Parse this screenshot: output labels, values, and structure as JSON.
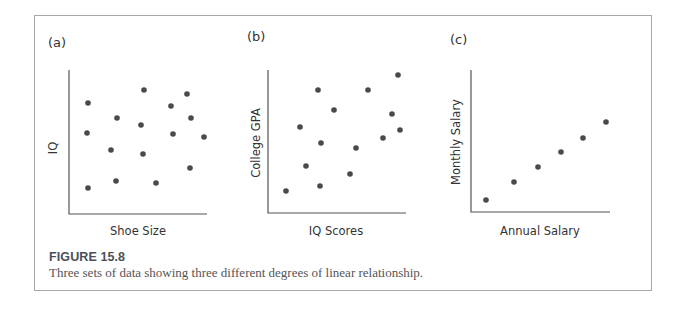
{
  "figure": {
    "title": "FIGURE 15.8",
    "caption": "Three sets of data showing three different degrees of linear relationship."
  },
  "chart_data": [
    {
      "type": "scatter",
      "panel_label": "(a)",
      "xlabel": "Shoe Size",
      "ylabel": "IQ",
      "title": "",
      "grid": false,
      "ticks": false,
      "relationship": "none",
      "axes_px": {
        "x0": 69,
        "y_top": 70,
        "y_bottom": 214,
        "x_end": 207
      },
      "points_px": [
        [
          88,
          103
        ],
        [
          144,
          90
        ],
        [
          187,
          94
        ],
        [
          171,
          106
        ],
        [
          117,
          118
        ],
        [
          191,
          118
        ],
        [
          141,
          125
        ],
        [
          87,
          133
        ],
        [
          173,
          134
        ],
        [
          204,
          137
        ],
        [
          111,
          150
        ],
        [
          143,
          154
        ],
        [
          190,
          168
        ],
        [
          116,
          181
        ],
        [
          156,
          183
        ],
        [
          88,
          188
        ]
      ],
      "x": [
        0.14,
        0.55,
        0.86,
        0.74,
        0.35,
        0.89,
        0.52,
        0.13,
        0.75,
        0.98,
        0.3,
        0.54,
        0.88,
        0.34,
        0.63,
        0.14
      ],
      "y": [
        0.78,
        0.87,
        0.84,
        0.76,
        0.67,
        0.67,
        0.62,
        0.56,
        0.56,
        0.53,
        0.44,
        0.42,
        0.32,
        0.23,
        0.22,
        0.18
      ]
    },
    {
      "type": "scatter",
      "panel_label": "(b)",
      "xlabel": "IQ Scores",
      "ylabel": "College GPA",
      "title": "",
      "grid": false,
      "ticks": false,
      "relationship": "moderate positive",
      "axes_px": {
        "x0": 268,
        "y_top": 70,
        "y_bottom": 213,
        "x_end": 406
      },
      "points_px": [
        [
          398,
          75
        ],
        [
          318,
          90
        ],
        [
          368,
          90
        ],
        [
          334,
          110
        ],
        [
          392,
          114
        ],
        [
          300,
          127
        ],
        [
          400,
          130
        ],
        [
          383,
          138
        ],
        [
          321,
          143
        ],
        [
          356,
          148
        ],
        [
          306,
          166
        ],
        [
          350,
          174
        ],
        [
          320,
          186
        ],
        [
          286,
          191
        ]
      ],
      "x": [
        0.94,
        0.36,
        0.72,
        0.48,
        0.9,
        0.23,
        0.96,
        0.83,
        0.38,
        0.64,
        0.28,
        0.59,
        0.38,
        0.13
      ],
      "y": [
        0.97,
        0.86,
        0.86,
        0.72,
        0.69,
        0.6,
        0.58,
        0.52,
        0.49,
        0.45,
        0.33,
        0.27,
        0.19,
        0.15
      ]
    },
    {
      "type": "scatter",
      "panel_label": "(c)",
      "xlabel": "Annual Salary",
      "ylabel": "Monthly Salary",
      "title": "",
      "grid": false,
      "ticks": false,
      "relationship": "perfect positive linear",
      "axes_px": {
        "x0": 471,
        "y_top": 70,
        "y_bottom": 212,
        "x_end": 610
      },
      "points_px": [
        [
          486,
          200
        ],
        [
          514,
          182
        ],
        [
          538,
          167
        ],
        [
          561,
          152
        ],
        [
          583,
          138
        ],
        [
          606,
          122
        ]
      ],
      "x": [
        0.11,
        0.31,
        0.48,
        0.65,
        0.81,
        0.97
      ],
      "y": [
        0.08,
        0.21,
        0.32,
        0.42,
        0.52,
        0.63
      ]
    }
  ],
  "labels": {
    "a": {
      "panel": "(a)",
      "x": "Shoe Size",
      "y": "IQ"
    },
    "b": {
      "panel": "(b)",
      "x": "IQ Scores",
      "y": "College GPA"
    },
    "c": {
      "panel": "(c)",
      "x": "Annual Salary",
      "y": "Monthly Salary"
    }
  },
  "colors": {
    "dot": "#4a4a4a",
    "axis": "#555555",
    "frame": "#a8a8a8",
    "caption_title": "#4a4f57"
  }
}
